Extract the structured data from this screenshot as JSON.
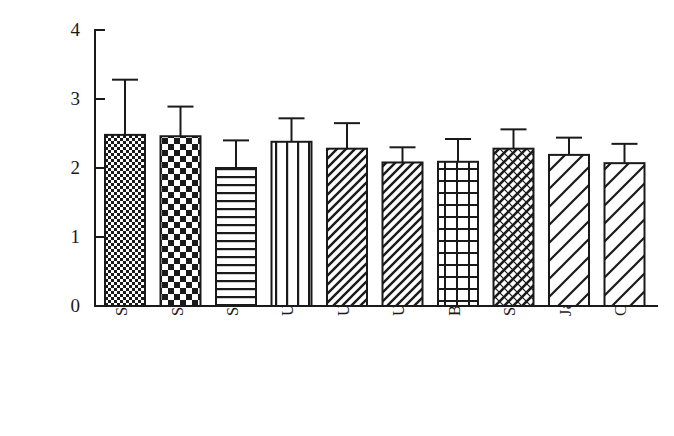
{
  "chart_data": {
    "type": "bar",
    "title": "",
    "xlabel": "",
    "ylabel": "ABTS自由基清除能力/（μmolTE/g）",
    "ylim": [
      0,
      4
    ],
    "yticks": [
      "0",
      "1",
      "2",
      "3",
      "4"
    ],
    "grid": false,
    "legend": "none",
    "error_bars": "upper only",
    "categories": [
      "SS520",
      "SSMPV57",
      "SS5205",
      "USG3555",
      "USG3665",
      "USG3315",
      "Branson",
      "Shirley",
      "Jamestown",
      "Chesapeake"
    ],
    "values": [
      2.48,
      2.46,
      2.0,
      2.38,
      2.28,
      2.08,
      2.09,
      2.28,
      2.19,
      2.07
    ],
    "errors": [
      0.8,
      0.43,
      0.4,
      0.34,
      0.37,
      0.22,
      0.33,
      0.28,
      0.25,
      0.28
    ],
    "fill_patterns": [
      "fine-checker",
      "coarse-checker",
      "horizontal-lines",
      "vertical-lines",
      "diagonal-hatch-dense",
      "diagonal-hatch-dense",
      "grid-crosshatch",
      "diagonal-crosshatch",
      "diagonal-lines-wide",
      "diagonal-lines-wide"
    ],
    "colors": {
      "axis": "#1a1a1a",
      "bar_stroke": "#1a1a1a",
      "bar_fill": "#ffffff",
      "background": "#ffffff"
    }
  }
}
